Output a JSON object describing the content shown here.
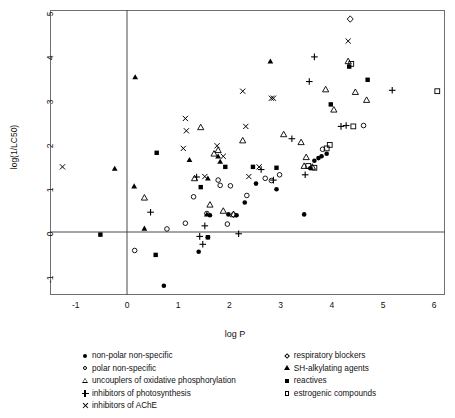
{
  "chart_data": {
    "type": "scatter",
    "title": "",
    "xlabel": "log P",
    "ylabel": "log(1/LC50)",
    "xlim": [
      -1.5,
      6.25
    ],
    "ylim": [
      -1.5,
      5.2
    ],
    "xticks": [
      -1,
      0,
      1,
      2,
      3,
      4,
      5,
      6
    ],
    "yticks": [
      -1,
      0,
      1,
      2,
      3,
      4,
      5
    ],
    "grid": false,
    "reference_lines": [
      {
        "axis": "x",
        "value": 0
      },
      {
        "axis": "y",
        "value": 0
      }
    ],
    "legend_position": "below-plot",
    "series": [
      {
        "name": "non-polar non-specific",
        "marker": "filled-circle",
        "points": [
          [
            0.72,
            -1.22
          ],
          [
            1.4,
            -0.45
          ],
          [
            1.58,
            -0.12
          ],
          [
            1.62,
            0.38
          ],
          [
            1.98,
            0.4
          ],
          [
            2.14,
            0.38
          ],
          [
            2.3,
            0.67
          ],
          [
            2.52,
            1.1
          ],
          [
            2.92,
            0.97
          ],
          [
            3.58,
            1.45
          ],
          [
            3.66,
            1.62
          ],
          [
            3.74,
            1.68
          ],
          [
            3.8,
            1.72
          ],
          [
            3.9,
            1.78
          ],
          [
            3.46,
            0.4
          ]
        ]
      },
      {
        "name": "polar non-specific",
        "marker": "open-circle",
        "points": [
          [
            0.15,
            -0.42
          ],
          [
            0.78,
            0.07
          ],
          [
            1.14,
            0.2
          ],
          [
            1.3,
            0.8
          ],
          [
            1.56,
            0.42
          ],
          [
            1.78,
            1.18
          ],
          [
            1.82,
            1.06
          ],
          [
            1.96,
            0.18
          ],
          [
            2.02,
            1.05
          ],
          [
            2.34,
            0.83
          ],
          [
            2.7,
            1.22
          ],
          [
            2.82,
            1.17
          ],
          [
            2.98,
            1.3
          ],
          [
            3.82,
            1.88
          ],
          [
            4.62,
            2.42
          ]
        ]
      },
      {
        "name": "uncouplers of oxidative phosphorylation",
        "marker": "open-triangle",
        "points": [
          [
            0.34,
            0.78
          ],
          [
            1.32,
            1.22
          ],
          [
            1.44,
            2.38
          ],
          [
            1.7,
            1.78
          ],
          [
            1.78,
            1.86
          ],
          [
            1.62,
            0.62
          ],
          [
            1.88,
            0.48
          ],
          [
            2.08,
            0.4
          ],
          [
            2.26,
            2.08
          ],
          [
            3.06,
            2.22
          ],
          [
            3.4,
            2.04
          ],
          [
            3.5,
            1.7
          ],
          [
            3.46,
            1.5
          ],
          [
            3.62,
            1.48
          ],
          [
            3.88,
            3.24
          ],
          [
            4.04,
            2.78
          ],
          [
            4.32,
            3.88
          ],
          [
            4.46,
            3.18
          ],
          [
            4.68,
            3.0
          ]
        ]
      },
      {
        "name": "inhibitors of photosynthesis",
        "marker": "plus",
        "points": [
          [
            0.46,
            0.45
          ],
          [
            1.36,
            1.25
          ],
          [
            1.52,
            0.14
          ],
          [
            1.42,
            -0.1
          ],
          [
            1.48,
            -0.28
          ],
          [
            2.18,
            -0.04
          ],
          [
            2.62,
            1.42
          ],
          [
            2.86,
            1.18
          ],
          [
            3.22,
            2.12
          ],
          [
            3.48,
            1.3
          ],
          [
            3.56,
            3.42
          ],
          [
            3.66,
            3.98
          ],
          [
            4.18,
            2.4
          ],
          [
            4.28,
            2.42
          ],
          [
            5.18,
            3.22
          ]
        ]
      },
      {
        "name": "inhibitors of AChE",
        "marker": "cross",
        "points": [
          [
            -1.26,
            1.48
          ],
          [
            1.1,
            1.9
          ],
          [
            1.14,
            2.58
          ],
          [
            1.16,
            2.3
          ],
          [
            1.52,
            1.26
          ],
          [
            1.76,
            1.96
          ],
          [
            1.88,
            1.72
          ],
          [
            2.26,
            3.2
          ],
          [
            2.32,
            2.4
          ],
          [
            2.38,
            1.26
          ],
          [
            2.58,
            1.48
          ],
          [
            2.82,
            3.04
          ],
          [
            2.86,
            3.04
          ],
          [
            4.32,
            4.34
          ]
        ]
      },
      {
        "name": "respiratory blockers",
        "marker": "open-diamond",
        "points": [
          [
            4.36,
            4.84
          ],
          [
            2.08,
            0.4
          ]
        ]
      },
      {
        "name": "SH-alkylating agents",
        "marker": "filled-triangle",
        "points": [
          [
            0.16,
            3.52
          ],
          [
            -0.24,
            1.44
          ],
          [
            0.14,
            1.04
          ],
          [
            0.34,
            0.08
          ],
          [
            1.22,
            1.64
          ],
          [
            1.56,
            0.4
          ],
          [
            1.58,
            1.22
          ],
          [
            1.78,
            1.72
          ],
          [
            1.82,
            1.6
          ],
          [
            2.8,
            3.88
          ]
        ]
      },
      {
        "name": "reactives",
        "marker": "filled-square",
        "points": [
          [
            -0.52,
            -0.06
          ],
          [
            0.56,
            -0.52
          ],
          [
            0.58,
            1.8
          ],
          [
            1.44,
            1.02
          ],
          [
            1.58,
            -0.12
          ],
          [
            1.92,
            1.48
          ],
          [
            2.46,
            1.48
          ],
          [
            2.92,
            1.46
          ],
          [
            3.98,
            2.9
          ],
          [
            4.34,
            3.76
          ],
          [
            4.7,
            3.46
          ]
        ]
      },
      {
        "name": "estrogenic compounds",
        "marker": "open-square",
        "points": [
          [
            3.54,
            1.5
          ],
          [
            3.66,
            1.46
          ],
          [
            3.9,
            1.9
          ],
          [
            3.96,
            1.98
          ],
          [
            4.42,
            2.4
          ],
          [
            4.38,
            3.82
          ],
          [
            6.06,
            3.2
          ]
        ]
      }
    ]
  },
  "axis": {
    "yticks": [
      "5",
      "4",
      "3",
      "2",
      "1",
      "0",
      "-1"
    ],
    "xticks": [
      "-1",
      "0",
      "1",
      "2",
      "3",
      "4",
      "5",
      "6"
    ],
    "xlabel": "log P",
    "ylabel": "log(1/LC50)"
  },
  "legend": {
    "left_column": [
      {
        "marker": "filled-circle",
        "label": "non-polar non-specific"
      },
      {
        "marker": "open-circle",
        "label": "polar non-specific"
      },
      {
        "marker": "open-triangle",
        "label": "uncouplers of oxidative phosphorylation"
      },
      {
        "marker": "plus",
        "label": "inhibitors of photosynthesis"
      },
      {
        "marker": "cross",
        "label": "inhibitors of AChE"
      }
    ],
    "right_column": [
      {
        "marker": "open-diamond",
        "label": "respiratory blockers"
      },
      {
        "marker": "filled-triangle",
        "label": "SH-alkylating agents"
      },
      {
        "marker": "filled-square",
        "label": "reactives"
      },
      {
        "marker": "open-square",
        "label": "estrogenic compounds"
      }
    ]
  },
  "colors": {
    "marker": "#000000",
    "frame": "#6f6f6f",
    "reference_line": "#4a4a4a",
    "text": "#111111",
    "background": "#ffffff"
  }
}
